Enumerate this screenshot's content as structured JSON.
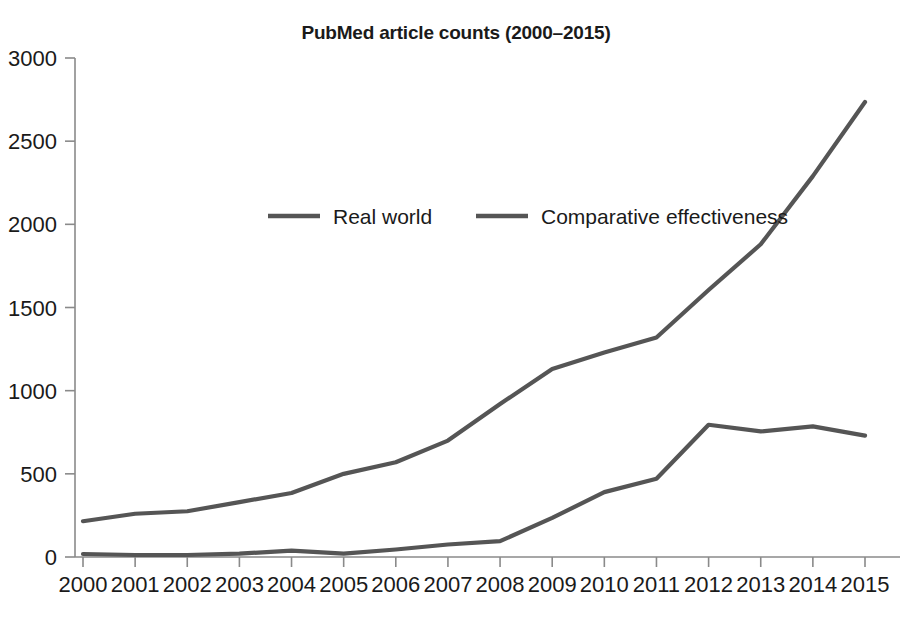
{
  "chart_data": {
    "type": "line",
    "title": "PubMed article counts (2000–2015)",
    "xlabel": "",
    "ylabel": "",
    "x": [
      2000,
      2001,
      2002,
      2003,
      2004,
      2005,
      2006,
      2007,
      2008,
      2009,
      2010,
      2011,
      2012,
      2013,
      2014,
      2015
    ],
    "categories": [
      "2000",
      "2001",
      "2002",
      "2003",
      "2004",
      "2005",
      "2006",
      "2007",
      "2008",
      "2009",
      "2010",
      "2011",
      "2012",
      "2013",
      "2014",
      "2015"
    ],
    "series": [
      {
        "name": "Real world",
        "color": "#555555",
        "values": [
          215,
          260,
          275,
          330,
          385,
          500,
          570,
          700,
          920,
          1130,
          1230,
          1320,
          1605,
          1880,
          2290,
          2735
        ]
      },
      {
        "name": "Comparative effectiveness",
        "color": "#555555",
        "values": [
          18,
          12,
          12,
          20,
          38,
          20,
          45,
          75,
          95,
          235,
          390,
          470,
          795,
          755,
          785,
          730
        ]
      }
    ],
    "xlim": [
      2000,
      2015
    ],
    "ylim": [
      0,
      3000
    ],
    "yticks": [
      0,
      500,
      1000,
      1500,
      2000,
      2500,
      3000
    ],
    "ytick_labels": [
      "0",
      "500",
      "1000",
      "1500",
      "2000",
      "2500",
      "3000"
    ],
    "grid": false,
    "legend_position": "upper-center-inside",
    "axis_color": "#8a8a8a",
    "background": "#ffffff"
  },
  "legend": {
    "entries": [
      {
        "label": "Real world",
        "color": "#555555"
      },
      {
        "label": "Comparative effectiveness",
        "color": "#555555"
      }
    ]
  }
}
